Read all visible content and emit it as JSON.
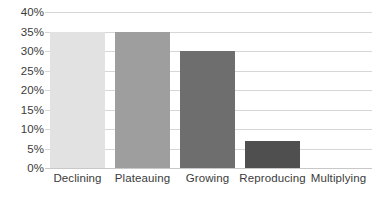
{
  "chart_data": {
    "type": "bar",
    "title": "",
    "subtitle": "",
    "xlabel": "",
    "ylabel": "",
    "categories": [
      "Declining",
      "Plateauing",
      "Growing",
      "Reproducing",
      "Multiplying"
    ],
    "values": [
      35,
      35,
      30,
      7,
      0
    ],
    "value_labels": [
      "35%",
      "35%",
      "30%",
      "7%",
      "0%"
    ],
    "series": [
      {
        "name": "Share",
        "values": [
          35,
          35,
          30,
          7,
          0
        ]
      }
    ],
    "ylim": [
      0,
      40
    ],
    "ytick_values": [
      0,
      5,
      10,
      15,
      20,
      25,
      30,
      35,
      40
    ],
    "ytick_labels": [
      "0%",
      "5%",
      "10%",
      "15%",
      "20%",
      "25%",
      "30%",
      "35%",
      "40%"
    ],
    "grid": true,
    "grid_axis": "y",
    "legend": false,
    "legend_position": "none",
    "bar_colors": [
      "#e2e2e2",
      "#9e9e9e",
      "#6e6e6e",
      "#4f4f4f",
      "#4f4f4f"
    ],
    "grid_color": "#d6d6d6",
    "axis_color": "#c8c8c8",
    "text_color": "#3b3b3b",
    "background_color": "#ffffff"
  }
}
